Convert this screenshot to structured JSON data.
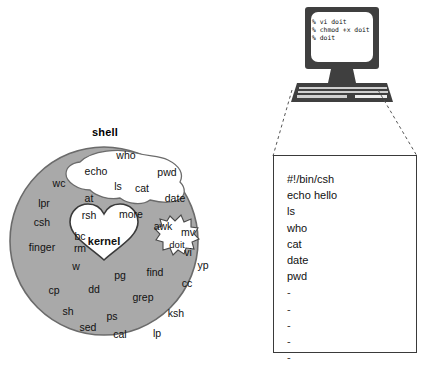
{
  "diagram": {
    "title_shell": "shell",
    "kernel_label": "kernel",
    "doit_label": "doit",
    "colors": {
      "shell_fill": "#a9a9a9",
      "shell_stroke": "#6b6b6b",
      "cloud_fill": "#ffffff",
      "kernel_fill": "#ffffff",
      "box_stroke": "#3a3a3a",
      "monitor_body": "#3f3f3f",
      "screen_fill": "#ffffff",
      "text": "#111111"
    },
    "cloud_commands": [
      {
        "label": "who",
        "x": 126,
        "y": 155
      },
      {
        "label": "echo",
        "x": 96,
        "y": 171
      },
      {
        "label": "pwd",
        "x": 167,
        "y": 172
      },
      {
        "label": "ls",
        "x": 118,
        "y": 186
      },
      {
        "label": "cat",
        "x": 142,
        "y": 188
      },
      {
        "label": "date",
        "x": 175,
        "y": 198
      }
    ],
    "shell_commands": [
      {
        "label": "wc",
        "x": 59,
        "y": 183
      },
      {
        "label": "at",
        "x": 89,
        "y": 198
      },
      {
        "label": "lpr",
        "x": 44,
        "y": 203
      },
      {
        "label": "rsh",
        "x": 89,
        "y": 215
      },
      {
        "label": "more",
        "x": 131,
        "y": 214
      },
      {
        "label": "csh",
        "x": 42,
        "y": 222
      },
      {
        "label": "awk",
        "x": 163,
        "y": 226
      },
      {
        "label": "mv",
        "x": 188,
        "y": 232
      },
      {
        "label": "bc",
        "x": 80,
        "y": 236
      },
      {
        "label": "finger",
        "x": 42,
        "y": 247
      },
      {
        "label": "rm",
        "x": 80,
        "y": 248
      },
      {
        "label": "vi",
        "x": 188,
        "y": 252
      },
      {
        "label": "yp",
        "x": 203,
        "y": 265
      },
      {
        "label": "w",
        "x": 76,
        "y": 266
      },
      {
        "label": "pg",
        "x": 120,
        "y": 275
      },
      {
        "label": "find",
        "x": 155,
        "y": 272
      },
      {
        "label": "cc",
        "x": 187,
        "y": 283
      },
      {
        "label": "cp",
        "x": 54,
        "y": 290
      },
      {
        "label": "dd",
        "x": 94,
        "y": 289
      },
      {
        "label": "grep",
        "x": 143,
        "y": 297
      },
      {
        "label": "sh",
        "x": 68,
        "y": 311
      },
      {
        "label": "ps",
        "x": 112,
        "y": 316
      },
      {
        "label": "ksh",
        "x": 176,
        "y": 313
      },
      {
        "label": "sed",
        "x": 88,
        "y": 327
      },
      {
        "label": "cal",
        "x": 120,
        "y": 334
      },
      {
        "label": "lp",
        "x": 157,
        "y": 333
      }
    ]
  },
  "computer": {
    "terminal_lines": [
      "% vi doit",
      "% chmod +x doit",
      "% doit"
    ]
  },
  "script": {
    "lines": [
      "#!/bin/csh",
      "echo hello",
      "ls",
      "who",
      "cat",
      "date",
      "pwd",
      "-",
      "-",
      "-",
      "-",
      "-"
    ]
  }
}
